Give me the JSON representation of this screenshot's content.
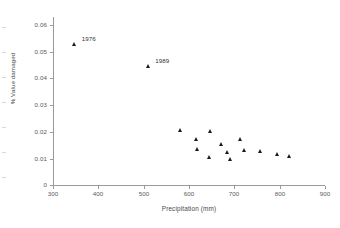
{
  "chart_data": {
    "type": "scatter",
    "title": "",
    "xlabel": "Precipitation (mm)",
    "ylabel": "% Value damaged",
    "xlim": [
      300,
      900
    ],
    "ylim": [
      0,
      0.06
    ],
    "xticks": [
      "300",
      "400",
      "500",
      "600",
      "700",
      "800",
      "900"
    ],
    "yticks": [
      "0",
      "0.01",
      "0.02",
      "0.03",
      "0.04",
      "0.05",
      "0.06"
    ],
    "grid": false,
    "legend": "none",
    "marker": "triangle",
    "marker_color": "#1a1a1a",
    "points": [
      {
        "x": 348,
        "y": 0.053,
        "label": "1976"
      },
      {
        "x": 510,
        "y": 0.0445,
        "label": "1989"
      },
      {
        "x": 581,
        "y": 0.0205,
        "label": ""
      },
      {
        "x": 616,
        "y": 0.0172,
        "label": ""
      },
      {
        "x": 647,
        "y": 0.0202,
        "label": ""
      },
      {
        "x": 620,
        "y": 0.0135,
        "label": ""
      },
      {
        "x": 673,
        "y": 0.0155,
        "label": ""
      },
      {
        "x": 646,
        "y": 0.0103,
        "label": ""
      },
      {
        "x": 686,
        "y": 0.0122,
        "label": ""
      },
      {
        "x": 692,
        "y": 0.0098,
        "label": ""
      },
      {
        "x": 713,
        "y": 0.0172,
        "label": ""
      },
      {
        "x": 722,
        "y": 0.0132,
        "label": ""
      },
      {
        "x": 757,
        "y": 0.0128,
        "label": ""
      },
      {
        "x": 795,
        "y": 0.0115,
        "label": ""
      },
      {
        "x": 821,
        "y": 0.011,
        "label": ""
      }
    ]
  },
  "axes": {
    "x_title": "Precipitation (mm)",
    "y_title": "% Value damaged",
    "x_tick_labels": [
      "300",
      "400",
      "500",
      "600",
      "700",
      "800",
      "900"
    ],
    "y_tick_labels": [
      "0.06",
      "0.05",
      "0.04",
      "0.03",
      "0.02",
      "0.01",
      "0"
    ]
  },
  "annotations": [
    {
      "text": "1976"
    },
    {
      "text": "1989"
    }
  ]
}
